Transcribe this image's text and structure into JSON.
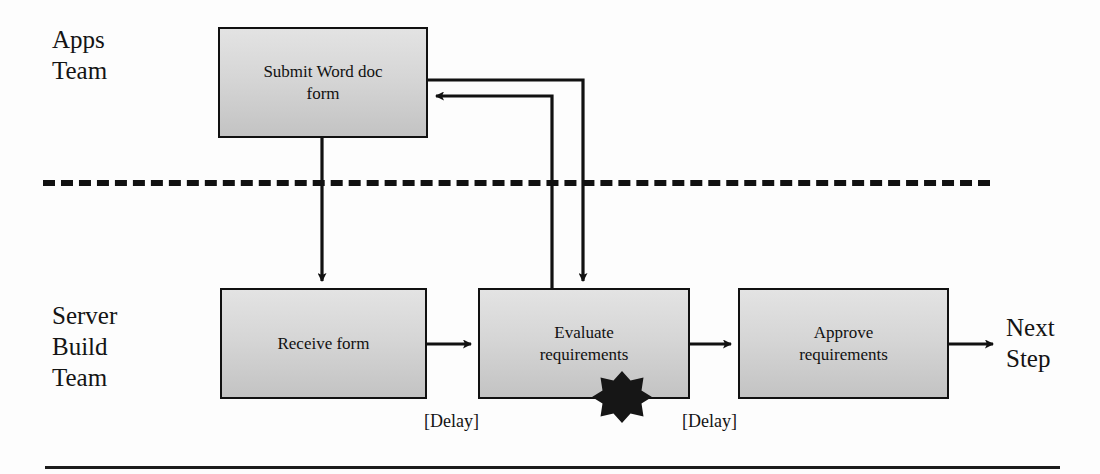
{
  "diagram": {
    "type": "swimlane-flowchart",
    "lanes": [
      {
        "id": "apps",
        "label": "Apps\nTeam"
      },
      {
        "id": "server",
        "label": "Server\nBuild\nTeam"
      }
    ],
    "nodes": [
      {
        "id": "submit",
        "lane": "apps",
        "label": "Submit Word doc\nform"
      },
      {
        "id": "receive",
        "lane": "server",
        "label": "Receive form"
      },
      {
        "id": "evaluate",
        "lane": "server",
        "label": "Evaluate\nrequirements"
      },
      {
        "id": "approve",
        "lane": "server",
        "label": "Approve\nrequirements"
      }
    ],
    "edge_labels": {
      "delay_1": "[Delay]",
      "delay_2": "[Delay]"
    },
    "terminator": "Next\nStep",
    "annotations": [
      {
        "id": "pain-point",
        "shape": "burst-star",
        "attached_to": "evaluate",
        "color": "#161616"
      }
    ],
    "colors": {
      "box_fill_top": "#e3e3e3",
      "box_fill_bottom": "#c3c3c3",
      "stroke": "#111111",
      "background": "#fdfdfd",
      "text": "#141414"
    }
  }
}
